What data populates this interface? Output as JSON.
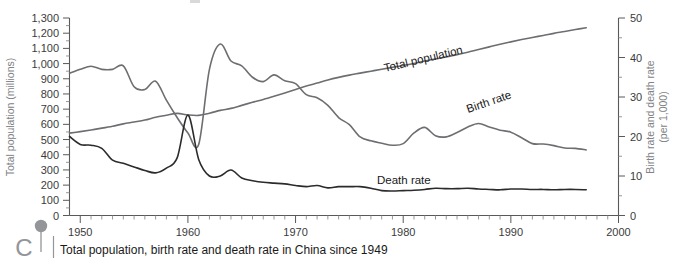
{
  "caption": {
    "text": "Total population, birth rate and death rate in China since 1949",
    "logo_letter": "C",
    "pin_icon": "map-pin-icon"
  },
  "left_axis": {
    "title": "Total population (millions)",
    "ticks": [
      "0",
      "100",
      "200",
      "300",
      "400",
      "500",
      "600",
      "700",
      "800",
      "900",
      "1,000",
      "1,100",
      "1,200",
      "1,300"
    ],
    "min": 0,
    "max": 1300
  },
  "right_axis": {
    "title_line1": "Birth rate and death rate",
    "title_line2": "(per 1,000)",
    "ticks": [
      "0",
      "10",
      "20",
      "30",
      "40",
      "50"
    ],
    "min": 0,
    "max": 50
  },
  "bottom_axis": {
    "ticks": [
      "1950",
      "1960",
      "1970",
      "1980",
      "1990",
      "2000"
    ],
    "min": 1949,
    "max": 2000
  },
  "series_labels": {
    "total_population": "Total population",
    "birth_rate": "Birth rate",
    "death_rate": "Death rate"
  },
  "colors": {
    "population_line": "#6d6e71",
    "birth_line": "#6d6e71",
    "death_line": "#2b2b2b",
    "axis": "#58595b",
    "axis_title": "#808285",
    "logo": "#939598"
  },
  "chart_data": {
    "type": "line",
    "title": "Total population, birth rate and death rate in China since 1949",
    "xlabel": "",
    "ylabel": "Total population (millions)",
    "y2label": "Birth rate and death rate (per 1,000)",
    "xlim": [
      1949,
      2000
    ],
    "ylim": [
      0,
      1300
    ],
    "y2lim": [
      0,
      50
    ],
    "grid": false,
    "legend": "inline-labels",
    "x": [
      1949,
      1950,
      1951,
      1952,
      1953,
      1954,
      1955,
      1956,
      1957,
      1958,
      1959,
      1960,
      1961,
      1962,
      1963,
      1964,
      1965,
      1966,
      1967,
      1968,
      1969,
      1970,
      1971,
      1972,
      1973,
      1974,
      1975,
      1976,
      1977,
      1978,
      1979,
      1980,
      1981,
      1982,
      1983,
      1984,
      1985,
      1986,
      1987,
      1988,
      1989,
      1990,
      1991,
      1992,
      1993,
      1994,
      1995,
      1996,
      1997
    ],
    "series": [
      {
        "name": "Total population",
        "axis": "left",
        "unit": "millions",
        "values": [
          542,
          552,
          563,
          575,
          588,
          603,
          615,
          628,
          647,
          660,
          672,
          662,
          659,
          673,
          692,
          705,
          725,
          745,
          764,
          785,
          807,
          830,
          852,
          872,
          892,
          909,
          924,
          937,
          950,
          963,
          975,
          987,
          1001,
          1017,
          1030,
          1044,
          1059,
          1075,
          1093,
          1110,
          1127,
          1143,
          1158,
          1172,
          1185,
          1199,
          1211,
          1224,
          1236
        ]
      },
      {
        "name": "Birth rate",
        "axis": "right",
        "unit": "per 1,000",
        "values": [
          36.0,
          37.0,
          37.8,
          37.0,
          37.0,
          37.9,
          32.6,
          31.9,
          34.0,
          29.2,
          24.8,
          20.9,
          18.0,
          37.0,
          43.4,
          39.1,
          37.9,
          35.0,
          33.9,
          35.6,
          34.1,
          33.4,
          30.6,
          29.8,
          27.9,
          24.8,
          23.0,
          19.9,
          18.9,
          18.3,
          17.8,
          18.2,
          20.9,
          22.3,
          20.2,
          19.9,
          21.0,
          22.4,
          23.3,
          22.4,
          21.6,
          21.1,
          19.7,
          18.2,
          18.1,
          17.7,
          17.1,
          17.0,
          16.6
        ]
      },
      {
        "name": "Death rate",
        "axis": "right",
        "unit": "per 1,000",
        "values": [
          20.0,
          18.0,
          17.8,
          17.0,
          14.0,
          13.2,
          12.3,
          11.4,
          10.8,
          12.0,
          14.6,
          25.4,
          14.2,
          10.0,
          10.0,
          11.5,
          9.5,
          8.8,
          8.4,
          8.2,
          8.0,
          7.6,
          7.3,
          7.6,
          7.0,
          7.3,
          7.3,
          7.3,
          6.9,
          6.3,
          6.2,
          6.3,
          6.4,
          6.6,
          6.9,
          6.8,
          6.8,
          6.9,
          6.7,
          6.6,
          6.5,
          6.7,
          6.7,
          6.6,
          6.6,
          6.5,
          6.6,
          6.6,
          6.5
        ]
      }
    ]
  }
}
